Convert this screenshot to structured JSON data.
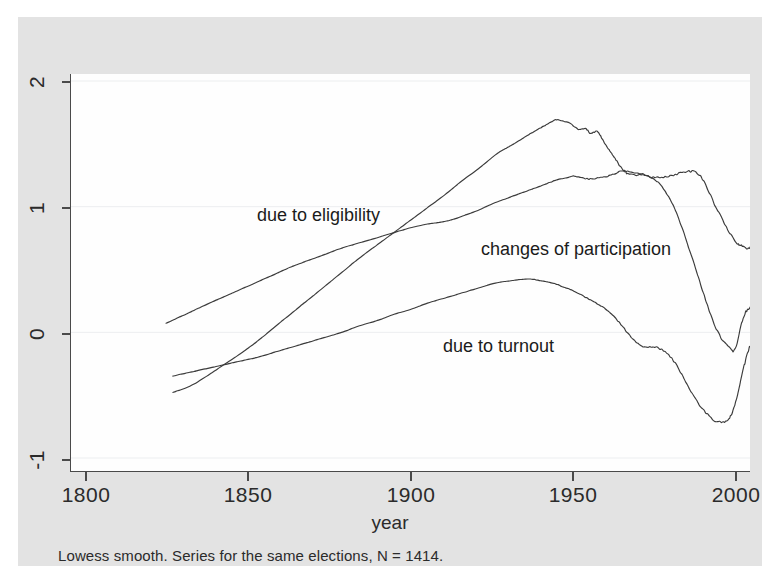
{
  "figure": {
    "note": "Lowess smooth. Series for the same elections, N = 1414.",
    "background_color": "#e3e3e3",
    "plot_background_color": "#fefefe",
    "line_color": "#3b3b3b"
  },
  "axes": {
    "x": {
      "label": "year",
      "ticks": [
        "1800",
        "1850",
        "1900",
        "1950",
        "2000"
      ],
      "min": 1800,
      "max": 2000
    },
    "y": {
      "label": "",
      "ticks": [
        "-1",
        "0",
        "1",
        "2"
      ],
      "min": -1,
      "max": 2
    }
  },
  "series_labels": [
    {
      "text": "due to eligibility",
      "x": 238,
      "y": 196
    },
    {
      "text": "changes of participation",
      "x": 462,
      "y": 230
    },
    {
      "text": "due to turnout",
      "x": 424,
      "y": 327
    }
  ],
  "chart_data": {
    "type": "line",
    "title": "",
    "subtitle": "Lowess smooth. Series for the same elections, N = 1414.",
    "xlabel": "year",
    "ylabel": "",
    "xlim": [
      1800,
      2000
    ],
    "ylim": [
      -1,
      2
    ],
    "xticks": [
      1800,
      1850,
      1900,
      1950,
      2000
    ],
    "yticks": [
      -1,
      0,
      1,
      2
    ],
    "grid": "horizontal",
    "legend_position": "inline-annotations",
    "n": 1414,
    "smoothing": "lowess",
    "series": [
      {
        "name": "due to eligibility",
        "x": [
          1830,
          1835,
          1840,
          1845,
          1850,
          1855,
          1860,
          1865,
          1870,
          1875,
          1880,
          1885,
          1890,
          1895,
          1900,
          1905,
          1910,
          1915,
          1920,
          1925,
          1928,
          1930,
          1933,
          1936,
          1938,
          1940,
          1942,
          1943,
          1945,
          1947,
          1949,
          1950,
          1951,
          1952,
          1953,
          1954,
          1955,
          1956,
          1957,
          1958,
          1959,
          1960,
          1961,
          1962,
          1963,
          1964,
          1966,
          1968,
          1970,
          1972,
          1974,
          1976,
          1978,
          1980,
          1982,
          1984,
          1986,
          1988,
          1990,
          1992,
          1994,
          1996,
          1997,
          1998,
          1999,
          2000
        ],
        "values": [
          -0.47,
          -0.42,
          -0.34,
          -0.25,
          -0.16,
          -0.06,
          0.05,
          0.16,
          0.27,
          0.38,
          0.49,
          0.6,
          0.7,
          0.8,
          0.9,
          1.0,
          1.1,
          1.21,
          1.31,
          1.42,
          1.47,
          1.5,
          1.55,
          1.6,
          1.63,
          1.66,
          1.69,
          1.7,
          1.69,
          1.67,
          1.63,
          1.62,
          1.63,
          1.62,
          1.59,
          1.6,
          1.61,
          1.57,
          1.52,
          1.48,
          1.44,
          1.4,
          1.36,
          1.32,
          1.29,
          1.27,
          1.26,
          1.26,
          1.25,
          1.24,
          1.24,
          1.25,
          1.26,
          1.28,
          1.29,
          1.28,
          1.23,
          1.12,
          1.0,
          0.9,
          0.8,
          0.72,
          0.7,
          0.69,
          0.68,
          0.68
        ]
      },
      {
        "name": "due to turnout",
        "x": [
          1830,
          1835,
          1840,
          1845,
          1850,
          1855,
          1860,
          1865,
          1870,
          1875,
          1880,
          1885,
          1890,
          1895,
          1900,
          1905,
          1910,
          1915,
          1920,
          1925,
          1930,
          1933,
          1936,
          1938,
          1940,
          1942,
          1944,
          1946,
          1948,
          1950,
          1952,
          1954,
          1956,
          1958,
          1960,
          1962,
          1964,
          1966,
          1968,
          1970,
          1972,
          1974,
          1976,
          1978,
          1980,
          1982,
          1984,
          1986,
          1988,
          1990,
          1992,
          1993,
          1994,
          1995,
          1996,
          1997,
          1998,
          1999,
          2000
        ],
        "values": [
          -0.34,
          -0.31,
          -0.28,
          -0.25,
          -0.22,
          -0.19,
          -0.15,
          -0.11,
          -0.07,
          -0.03,
          0.01,
          0.06,
          0.1,
          0.15,
          0.19,
          0.24,
          0.28,
          0.32,
          0.36,
          0.4,
          0.42,
          0.43,
          0.43,
          0.42,
          0.41,
          0.4,
          0.38,
          0.36,
          0.34,
          0.31,
          0.28,
          0.25,
          0.22,
          0.18,
          0.13,
          0.07,
          0.0,
          -0.06,
          -0.1,
          -0.11,
          -0.11,
          -0.13,
          -0.17,
          -0.24,
          -0.33,
          -0.43,
          -0.52,
          -0.6,
          -0.66,
          -0.7,
          -0.71,
          -0.7,
          -0.67,
          -0.61,
          -0.52,
          -0.41,
          -0.29,
          -0.18,
          -0.1
        ]
      },
      {
        "name": "changes of participation",
        "x": [
          1828,
          1832,
          1836,
          1840,
          1845,
          1850,
          1855,
          1860,
          1865,
          1870,
          1875,
          1880,
          1885,
          1890,
          1895,
          1900,
          1905,
          1908,
          1910,
          1913,
          1916,
          1920,
          1924,
          1928,
          1932,
          1936,
          1940,
          1943,
          1946,
          1948,
          1950,
          1952,
          1954,
          1956,
          1958,
          1960,
          1962,
          1964,
          1966,
          1968,
          1970,
          1972,
          1974,
          1976,
          1978,
          1980,
          1982,
          1984,
          1986,
          1988,
          1990,
          1992,
          1994,
          1995,
          1996,
          1997,
          1998,
          1999,
          2000
        ],
        "values": [
          0.08,
          0.13,
          0.18,
          0.23,
          0.29,
          0.35,
          0.41,
          0.47,
          0.53,
          0.58,
          0.63,
          0.68,
          0.72,
          0.76,
          0.8,
          0.84,
          0.87,
          0.88,
          0.89,
          0.91,
          0.94,
          0.98,
          1.03,
          1.07,
          1.11,
          1.15,
          1.19,
          1.22,
          1.24,
          1.25,
          1.24,
          1.23,
          1.23,
          1.24,
          1.25,
          1.27,
          1.29,
          1.29,
          1.28,
          1.27,
          1.25,
          1.22,
          1.17,
          1.09,
          0.98,
          0.84,
          0.68,
          0.51,
          0.34,
          0.18,
          0.04,
          -0.06,
          -0.12,
          -0.14,
          -0.1,
          0.02,
          0.12,
          0.18,
          0.2
        ]
      }
    ]
  }
}
